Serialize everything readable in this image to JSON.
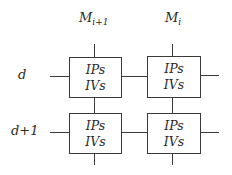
{
  "diagram": {
    "columns": [
      {
        "label_base": "M",
        "label_sub": "i+1"
      },
      {
        "label_base": "M",
        "label_sub": "i"
      }
    ],
    "rows": [
      {
        "label": "d"
      },
      {
        "label": "d+1"
      }
    ],
    "cells": [
      {
        "row": 0,
        "col": 0,
        "line1": "IPs",
        "line2": "IVs"
      },
      {
        "row": 0,
        "col": 1,
        "line1": "IPs",
        "line2": "IVs"
      },
      {
        "row": 1,
        "col": 0,
        "line1": "IPs",
        "line2": "IVs"
      },
      {
        "row": 1,
        "col": 1,
        "line1": "IPs",
        "line2": "IVs"
      }
    ],
    "colors": {
      "stroke": "#3a3a3a",
      "text": "#2a2a2a",
      "background": "#ffffff"
    }
  }
}
